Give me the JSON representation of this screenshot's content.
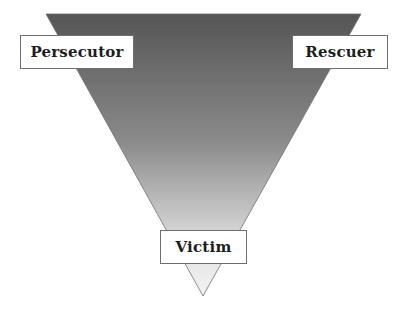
{
  "diagram": {
    "type": "inverted-triangle",
    "shape": {
      "gradient_top_color": "#555555",
      "gradient_mid_color": "#8a8a8a",
      "gradient_bottom_color": "#f2f2f2",
      "outline_color": "#707070"
    },
    "labels": {
      "top_left": "Persecutor",
      "top_right": "Rescuer",
      "bottom": "Victim"
    }
  }
}
